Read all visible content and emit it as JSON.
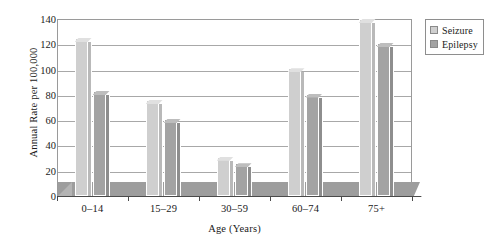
{
  "chart_data": {
    "type": "bar",
    "title": "",
    "subtitle": "",
    "xlabel": "Age (Years)",
    "ylabel": "Annual Rate per 100,000",
    "categories": [
      "0–14",
      "15–29",
      "30–59",
      "60–74",
      "75+"
    ],
    "series": [
      {
        "name": "Seizure",
        "color": "#cfcfcf",
        "values": [
          125,
          76,
          31,
          101,
          140
        ]
      },
      {
        "name": "Epilepsy",
        "color": "#a3a3a3",
        "values": [
          83,
          61,
          26,
          81,
          121
        ]
      }
    ],
    "ylim": [
      0,
      140
    ],
    "yticks": [
      0,
      20,
      40,
      60,
      80,
      100,
      120,
      140
    ],
    "ytick_labels": [
      "0",
      "20",
      "40",
      "60",
      "80",
      "100",
      "120",
      "140"
    ],
    "grid": true,
    "grid_axis": "y",
    "legend_position": "top-right",
    "bar_style": "3d-column",
    "background_color": "#ffffff",
    "axis_color": "#4a4a4a",
    "grid_color": "#a8a8a8"
  },
  "legend": {
    "items": [
      {
        "label": "Seizure",
        "swatch": "seizure-swatch"
      },
      {
        "label": "Epilepsy",
        "swatch": "epilepsy-swatch"
      }
    ]
  }
}
